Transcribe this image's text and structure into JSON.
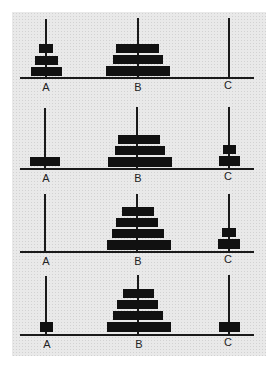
{
  "diagram": {
    "colors": {
      "background": "#e9e9e9",
      "disk": "#111111",
      "line": "#1a1a1a"
    },
    "peg_labels": [
      "A",
      "B",
      "C"
    ],
    "panels": [
      {
        "state": 1,
        "labels": [
          "A",
          "B",
          "C"
        ],
        "pegs": {
          "A": [
            3,
            2,
            1
          ],
          "B": [
            6,
            5,
            4
          ],
          "C": []
        }
      },
      {
        "state": 2,
        "labels": [
          "A",
          "B",
          "C"
        ],
        "pegs": {
          "A": [
            3
          ],
          "B": [
            6,
            5,
            4
          ],
          "C": [
            2,
            1
          ]
        }
      },
      {
        "state": 3,
        "labels": [
          "A",
          "B",
          "C"
        ],
        "pegs": {
          "A": [],
          "B": [
            6,
            5,
            4,
            3
          ],
          "C": [
            2,
            1
          ]
        }
      },
      {
        "state": 4,
        "labels": [
          "A",
          "B",
          "C"
        ],
        "pegs": {
          "A": [
            1
          ],
          "B": [
            6,
            5,
            4,
            3
          ],
          "C": [
            2
          ]
        }
      }
    ]
  }
}
